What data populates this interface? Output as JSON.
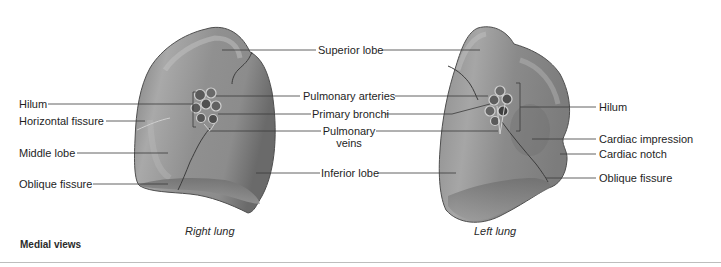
{
  "figure": {
    "view_title": "Medial views",
    "right_lung": {
      "caption": "Right lung",
      "left_labels": [
        {
          "id": "hilum",
          "text": "Hilum"
        },
        {
          "id": "horizontal-fissure",
          "text": "Horizontal fissure"
        },
        {
          "id": "middle-lobe",
          "text": "Middle lobe"
        },
        {
          "id": "oblique-fissure",
          "text": "Oblique fissure"
        }
      ]
    },
    "center_labels": {
      "superior_lobe": "Superior lobe",
      "pulmonary_arteries": "Pulmonary arteries",
      "primary_bronchi": "Primary bronchi",
      "pulmonary_veins_line1": "Pulmonary",
      "pulmonary_veins_line2": "veins",
      "inferior_lobe": "Inferior lobe"
    },
    "left_lung": {
      "caption": "Left lung",
      "right_labels": [
        {
          "id": "hilum",
          "text": "Hilum"
        },
        {
          "id": "cardiac-impression",
          "text": "Cardiac impression"
        },
        {
          "id": "cardiac-notch",
          "text": "Cardiac notch"
        },
        {
          "id": "oblique-fissure",
          "text": "Oblique fissure"
        }
      ]
    },
    "colors": {
      "lung_base": "#8a8a8a",
      "lung_highlight": "#b4b4b4",
      "lung_shadow": "#5e5e5e",
      "leader_line": "#3a3a3a",
      "rule": "#bdbdbd"
    }
  }
}
